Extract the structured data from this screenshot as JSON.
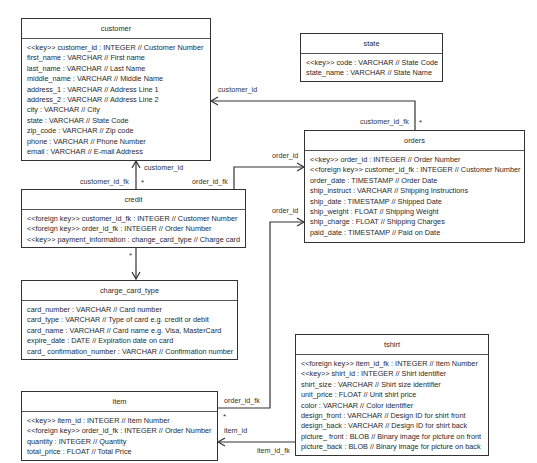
{
  "diagram": {
    "type": "uml-class-diagram",
    "entities": {
      "customer": {
        "name": "customer",
        "attributes": [
          "<<key>> customer_id : INTEGER  // Customer Number",
          "first_name : VARCHAR  // First name",
          "last_name : VARCHAR  // Last Name",
          "middle_name : VARCHAR  // Middle Name",
          "address_1 : VARCHAR  // Address Line 1",
          "address_2 : VARCHAR  // Address Line 2",
          "city : VARCHAR  // City",
          "state : VARCHAR  // State Code",
          "zip_code : VARCHAR  // Zip code",
          "phone : VARCHAR  // Phone Number",
          "email : VARCHAR  // E-mail Address"
        ]
      },
      "state": {
        "name": "state",
        "attributes": [
          "<<key>> code : VARCHAR  // State Code",
          "state_name : VARCHAR  // State Name"
        ]
      },
      "orders": {
        "name": "orders",
        "attributes": [
          "<<key>> order_id : INTEGER  // Order Number",
          "<<foreign key>> customer_id_fk : INTEGER  // Customer Number",
          "order_date : TIMESTAMP  // Order Date",
          "ship_instruct : VARCHAR  // Shipping Instructions",
          "ship_date : TIMESTAMP  // Shipped Date",
          "ship_weight : FLOAT  // Shipping Weight",
          "ship_charge : FLOAT  // Shipping Charges",
          "paid_date : TIMESTAMP  // Paid on Date"
        ]
      },
      "credit": {
        "name": "credit",
        "attributes": [
          "<<foreign key>> customer_id_fk : INTEGER  // Customer Number",
          "<<foreign key>> order_id_fk : INTEGER  // Order Number",
          "<<key>> payment_information : change_card_type // Charge card"
        ]
      },
      "charge_card_type": {
        "name": "charge_card_type",
        "attributes": [
          "card_number : VARCHAR // Card number",
          "card_type : VARCHAR // Type of card e.g. credit or debit",
          "card_name : VARCHAR // Card name e.g. Visa, MasterCard",
          "expire_date : DATE // Expiration date on card",
          "card_ confirmation_number : VARCHAR // Confirmation number"
        ]
      },
      "item": {
        "name": "item",
        "attributes": [
          "<<key>> item_id : INTEGER  // Item Number",
          "<<foreign key>> order_id_fk : INTEGER  // Order Number",
          "quantity : INTEGER  // Quantity",
          "total_price : FLOAT  // Total Price"
        ]
      },
      "tshirt": {
        "name": "tshirt",
        "attributes": [
          "<<foreign key>> item_id_fk : INTEGER  // Item Number",
          "<<key>> shirt_id : INTEGER  // Shirt identifier",
          "shirt_size : VARCHAR  // Shirt size identifier",
          "unit_price : FLOAT // Unit shirt price",
          "color : VARCHAR // Color identifier",
          "design_front : VARCHAR // Design ID for shirt front",
          "design_back : VARCHAR  // Design ID for shirt back",
          "picture_ front : BLOB // Binary image for picture on front",
          "picture_back : BLOB // Binary image for picture on back"
        ]
      }
    },
    "relationships": {
      "orders_customer": {
        "target_label": "customer_id",
        "source_label": "customer_id_fk",
        "multiplicity": "*"
      },
      "credit_customer": {
        "target_label": "customer_id",
        "source_label": "customer_id_fk",
        "multiplicity": "*"
      },
      "credit_orders": {
        "target_label": "order_id",
        "source_label": "order_id_fk"
      },
      "credit_charge_card_type": {
        "multiplicity": "*"
      },
      "item_orders": {
        "target_label": "order_id",
        "source_label": "order_id_fk",
        "multiplicity": "*"
      },
      "tshirt_item": {
        "target_label": "item_id",
        "source_label": "item_id_fk"
      }
    }
  }
}
